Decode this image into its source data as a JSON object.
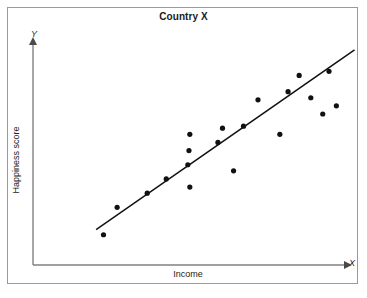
{
  "figure": {
    "title": "Country X",
    "frame_color": "#9a9a9a",
    "background": "#ffffff",
    "axis_color": "#808080",
    "point_color": "#111111",
    "line_color": "#111111"
  },
  "axes": {
    "x_label": "Income",
    "y_label": "Happiness score",
    "x_axis_letter": "X",
    "y_axis_letter": "Y",
    "x_origin_px": 33,
    "y_origin_px": 265,
    "x_end_px": 345,
    "y_end_px": 44
  },
  "chart_data": {
    "type": "scatter",
    "title": "Country X",
    "xlabel": "Income",
    "ylabel": "Happiness score",
    "grid": false,
    "legend": false,
    "axis_ticks": false,
    "xlim": [
      0,
      100
    ],
    "ylim": [
      0,
      100
    ],
    "points": [
      {
        "x": 13.2,
        "y": 7.5
      },
      {
        "x": 18.0,
        "y": 21.0
      },
      {
        "x": 28.6,
        "y": 28.0
      },
      {
        "x": 35.3,
        "y": 35.0
      },
      {
        "x": 42.9,
        "y": 42.0
      },
      {
        "x": 43.3,
        "y": 49.0
      },
      {
        "x": 43.6,
        "y": 31.0
      },
      {
        "x": 43.6,
        "y": 57.0
      },
      {
        "x": 53.5,
        "y": 53.0
      },
      {
        "x": 55.1,
        "y": 60.0
      },
      {
        "x": 62.5,
        "y": 61.0
      },
      {
        "x": 59.0,
        "y": 39.0
      },
      {
        "x": 67.6,
        "y": 74.0
      },
      {
        "x": 78.2,
        "y": 78.0
      },
      {
        "x": 82.1,
        "y": 86.0
      },
      {
        "x": 86.2,
        "y": 75.0
      },
      {
        "x": 90.4,
        "y": 67.0
      },
      {
        "x": 92.6,
        "y": 88.0
      },
      {
        "x": 95.2,
        "y": 71.0
      },
      {
        "x": 75.3,
        "y": 57.0
      }
    ],
    "trend_line": {
      "label": "line of best fit",
      "x_start": 10.6,
      "y_start": 10.0,
      "x_end": 101.6,
      "y_end": 98.6
    }
  }
}
